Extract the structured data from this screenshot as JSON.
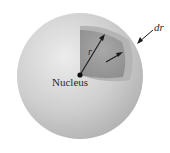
{
  "diagram": {
    "labels": {
      "nucleus": "Nucleus",
      "radius": "r",
      "shell_thickness": "dr"
    },
    "colors": {
      "sphere_outer": "#c8c8c8",
      "sphere_highlight": "#e6e6e6",
      "cutaway_wedge": "#a0a0a0",
      "inner_shell": "#8c8c8c",
      "nucleus_dot": "#111111",
      "arrows": "#1a1a1a"
    }
  }
}
